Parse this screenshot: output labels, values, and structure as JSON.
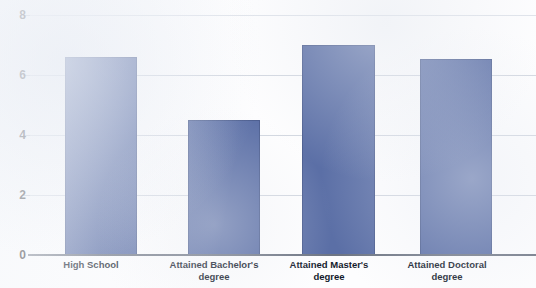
{
  "chart_data": {
    "type": "bar",
    "title": "",
    "subtitle": "",
    "xlabel": "",
    "ylabel": "",
    "categories": [
      "High School",
      "Attained Bachelor's degree",
      "Attained Master's degree",
      "Attained Doctoral degree"
    ],
    "values": [
      6.6,
      4.5,
      7.0,
      6.55
    ],
    "series": [
      {
        "name": "",
        "values": [
          6.6,
          4.5,
          7.0,
          6.55
        ]
      }
    ],
    "ylim": [
      0,
      8
    ],
    "y_ticks": [
      "0",
      "2",
      "4",
      "6",
      "8"
    ],
    "y_tick_values": [
      0,
      2,
      4,
      6,
      8
    ],
    "grid": true,
    "legend": false,
    "legend_position": "none",
    "bar_color": "#5b6fa6",
    "gridline_color": "#d2d7e0",
    "axis_color": "#6f7684",
    "background_color": "#fdfdfe",
    "annotations": []
  },
  "axis": {
    "y_ticks": [
      {
        "label": "8",
        "value": 8
      },
      {
        "label": "6",
        "value": 6
      },
      {
        "label": "4",
        "value": 4
      },
      {
        "label": "2",
        "value": 2
      },
      {
        "label": "0",
        "value": 0
      }
    ],
    "x_categories": [
      {
        "line1": "High School",
        "line2": ""
      },
      {
        "line1": "Attained Bachelor's",
        "line2": "degree"
      },
      {
        "line1": "Attained Master's",
        "line2": "degree"
      },
      {
        "line1": "Attained Doctoral",
        "line2": "degree"
      }
    ]
  }
}
